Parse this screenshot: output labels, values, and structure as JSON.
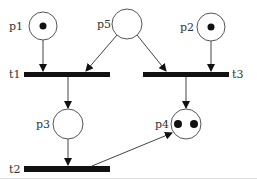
{
  "diagram": {
    "type": "petri-net",
    "places": [
      {
        "id": "p1",
        "label": "p1",
        "cx": 43,
        "cy": 26,
        "r": 14,
        "tokens": 1
      },
      {
        "id": "p5",
        "label": "p5",
        "cx": 127,
        "cy": 24,
        "r": 15,
        "tokens": 0
      },
      {
        "id": "p2",
        "label": "p2",
        "cx": 211,
        "cy": 27,
        "r": 14,
        "tokens": 1
      },
      {
        "id": "p3",
        "label": "p3",
        "cx": 68,
        "cy": 124,
        "r": 15,
        "tokens": 0
      },
      {
        "id": "p4",
        "label": "p4",
        "cx": 186,
        "cy": 124,
        "r": 15,
        "tokens": 2
      }
    ],
    "transitions": [
      {
        "id": "t1",
        "label": "t1",
        "x": 24,
        "y": 72,
        "w": 86,
        "h": 5
      },
      {
        "id": "t3",
        "label": "t3",
        "x": 143,
        "y": 72,
        "w": 86,
        "h": 5
      },
      {
        "id": "t2",
        "label": "t2",
        "x": 24,
        "y": 166,
        "w": 86,
        "h": 6
      }
    ],
    "arcs": [
      {
        "from": "p1",
        "to": "t1"
      },
      {
        "from": "p5",
        "to": "t1"
      },
      {
        "from": "p5",
        "to": "t3"
      },
      {
        "from": "p2",
        "to": "t3"
      },
      {
        "from": "t1",
        "to": "p3"
      },
      {
        "from": "t3",
        "to": "p4"
      },
      {
        "from": "p3",
        "to": "t2"
      },
      {
        "from": "t2",
        "to": "p4"
      }
    ]
  }
}
